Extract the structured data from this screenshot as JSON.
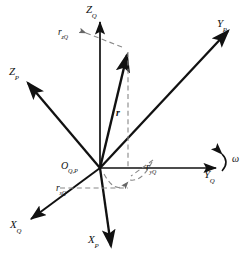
{
  "figure": {
    "background_color": "#ffffff",
    "stroke_color": "#111111",
    "dashed_color": "#777777"
  },
  "origin": {
    "name": "O",
    "subscript": "Q,P",
    "x": 100,
    "y": 168
  },
  "axes": [
    {
      "id": "ZQ",
      "name": "Z",
      "subscript": "Q",
      "label_x": 88,
      "label_y": 6,
      "tip_x": 100,
      "tip_y": 20,
      "style": "solid"
    },
    {
      "id": "YQ",
      "name": "Y",
      "subscript": "Q",
      "label_x": 206,
      "label_y": 175,
      "tip_x": 218,
      "tip_y": 168,
      "style": "solid"
    },
    {
      "id": "XQ",
      "name": "X",
      "subscript": "Q",
      "label_x": 12,
      "label_y": 224,
      "tip_x": 28,
      "tip_y": 220,
      "style": "solid"
    },
    {
      "id": "ZP",
      "name": "Z",
      "subscript": "P",
      "label_x": 10,
      "label_y": 72,
      "tip_x": 26,
      "tip_y": 82,
      "style": "solid"
    },
    {
      "id": "YP",
      "name": "Y",
      "subscript": "P",
      "label_x": 218,
      "label_y": 22,
      "tip_x": 230,
      "tip_y": 30,
      "style": "solid"
    },
    {
      "id": "XP",
      "name": "X",
      "subscript": "P",
      "label_x": 89,
      "label_y": 238,
      "tip_x": 112,
      "tip_y": 248,
      "style": "solid"
    }
  ],
  "vector": {
    "id": "r",
    "name": "r",
    "label_x": 117,
    "label_y": 113,
    "tip_x": 128,
    "tip_y": 52,
    "style": "solid-bold"
  },
  "components": [
    {
      "id": "rzQ",
      "name": "r",
      "subscript": "zQ",
      "label_x": 59,
      "label_y": 28,
      "axis": "ZQ"
    },
    {
      "id": "ryQ",
      "name": "r",
      "subscript": "yQ",
      "label_x": 147,
      "label_y": 166,
      "axis": "YQ"
    },
    {
      "id": "rxQ",
      "name": "r",
      "subscript": "xQ",
      "label_x": 57,
      "label_y": 185,
      "axis": "XQ"
    }
  ],
  "angular_velocity": {
    "id": "omega",
    "symbol": "ω",
    "label_x": 231,
    "label_y": 157,
    "arc": "curved-arrow-about-YQ"
  }
}
